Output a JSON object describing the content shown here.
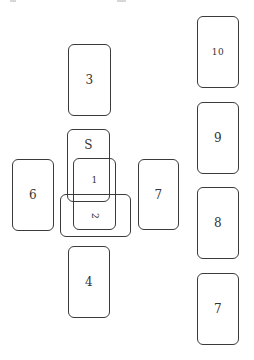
{
  "diagram": {
    "type": "tarot-spread-layout",
    "name": "Celtic Cross",
    "cards": [
      {
        "id": "S",
        "label": "S",
        "role": "significator",
        "x": 67,
        "y": 129,
        "w": 43,
        "h": 73,
        "orientation": "upright"
      },
      {
        "id": "1",
        "label": "1",
        "x": 73,
        "y": 158,
        "w": 43,
        "h": 72,
        "orientation": "upright"
      },
      {
        "id": "2",
        "label": "2",
        "x": 60,
        "y": 194,
        "w": 71,
        "h": 43,
        "orientation": "crossed"
      },
      {
        "id": "3",
        "label": "3",
        "x": 68,
        "y": 44,
        "w": 43,
        "h": 72,
        "orientation": "upright"
      },
      {
        "id": "4",
        "label": "4",
        "x": 68,
        "y": 246,
        "w": 42,
        "h": 72,
        "orientation": "upright"
      },
      {
        "id": "5",
        "label": "5",
        "x": 12,
        "y": 159,
        "w": 42,
        "h": 72,
        "orientation": "upright"
      },
      {
        "id": "6",
        "label": "6",
        "x": 138,
        "y": 159,
        "w": 41,
        "h": 71,
        "orientation": "upright"
      },
      {
        "id": "7",
        "label": "7",
        "x": 197,
        "y": 273,
        "w": 42,
        "h": 72,
        "orientation": "upright"
      },
      {
        "id": "8",
        "label": "8",
        "x": 197,
        "y": 187,
        "w": 42,
        "h": 72,
        "orientation": "upright"
      },
      {
        "id": "9",
        "label": "9",
        "x": 197,
        "y": 102,
        "w": 42,
        "h": 72,
        "orientation": "upright"
      },
      {
        "id": "10",
        "label": "10",
        "x": 197,
        "y": 16,
        "w": 42,
        "h": 72,
        "orientation": "upright"
      }
    ]
  },
  "colors": {
    "background": "#ffffff",
    "card_border": "#3a3a3a",
    "label": "#333333"
  }
}
